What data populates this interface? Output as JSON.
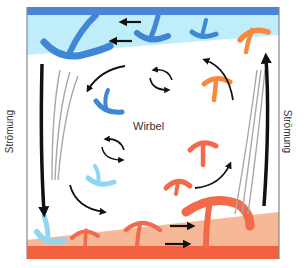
{
  "diagram": {
    "title": "",
    "labels": {
      "left_side": "Strömung",
      "right_side": "Strömung",
      "center": "Wirbel"
    },
    "colors": {
      "top_band": "#4a86d8",
      "cold_layer": "#bfeefa",
      "cold_plume": "#3f86d6",
      "cool_plume": "#8fd6f2",
      "warm_layer": "#f7b898",
      "bottom_band": "#f2603f",
      "hot_plume": "#f26a4a",
      "warm_plume": "#f5893e",
      "arrow": "#111111",
      "streamline": "#a8a8a8",
      "frame": "#888888"
    },
    "elements": [
      {
        "type": "layer",
        "name": "cold top layer"
      },
      {
        "type": "layer",
        "name": "warm bottom layer"
      },
      {
        "type": "plume",
        "direction": "down",
        "count": 6
      },
      {
        "type": "plume",
        "direction": "up",
        "count": 7
      },
      {
        "type": "arrow",
        "name": "downflow left"
      },
      {
        "type": "arrow",
        "name": "upflow right"
      },
      {
        "type": "vortex",
        "count": 2
      }
    ]
  }
}
